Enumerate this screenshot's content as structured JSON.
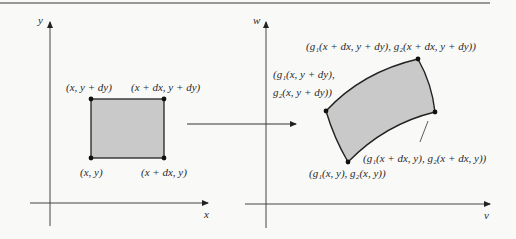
{
  "diagram": {
    "colors": {
      "background": "#f9f9f8",
      "line": "#222222",
      "axis": "#444444",
      "fill": "#c9c9c9",
      "rule": "#777777"
    },
    "left_panel": {
      "x_axis_label": "x",
      "y_axis_label": "y",
      "corners": {
        "top_left": "(x, y + dy)",
        "top_right": "(x + dx, y + dy)",
        "bottom_left": "(x, y)",
        "bottom_right": "(x + dx, y)"
      }
    },
    "right_panel": {
      "x_axis_label": "v",
      "y_axis_label": "w",
      "corners": {
        "top_right": "(g₁(x + dx, y + dy),  g₂(x + dx, y + dy))",
        "top_left_line1": "(g₁(x, y + dy),",
        "top_left_line2": "g₂(x, y + dy))",
        "right": "(g₁(x + dx, y), g₂(x + dx, y))",
        "bottom": "(g₁(x, y),  g₂(x, y))"
      }
    },
    "mapping_arrow": "maps rectangle to curved region"
  }
}
